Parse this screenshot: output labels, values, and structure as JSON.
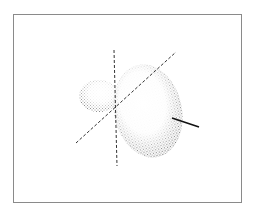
{
  "diagram": {
    "frame_color": "#8a8a8a",
    "stipple_color": "#555555",
    "axis_color": "#333333",
    "bond_color": "#111111",
    "elements": [
      {
        "name": "small-lobe",
        "shape": "ellipse"
      },
      {
        "name": "large-lobe",
        "shape": "ellipse"
      },
      {
        "name": "vertical-axis",
        "style": "dashed"
      },
      {
        "name": "diagonal-axis",
        "style": "dashed"
      },
      {
        "name": "bond-line",
        "style": "solid"
      }
    ]
  }
}
